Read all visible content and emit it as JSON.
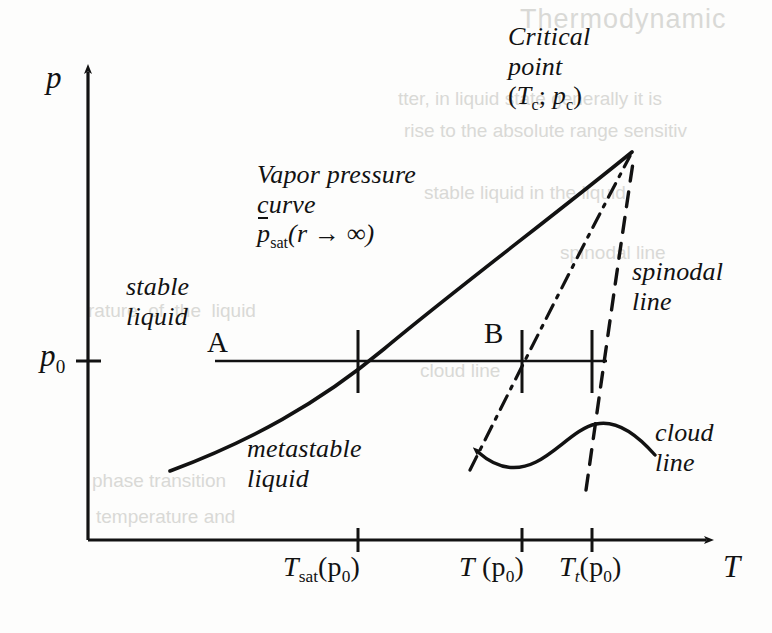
{
  "figure": {
    "kind": "phase-diagram",
    "caption": "",
    "axes": {
      "y_label": "p",
      "x_label": "T",
      "y_tick_label": "p",
      "y_tick_sub": "0",
      "x_ticks": [
        {
          "main": "T",
          "sub": "sat",
          "arg": "(p",
          "arg_sub": "0",
          "arg_close": ")"
        },
        {
          "main": "T",
          "sub": "",
          "arg": " (p",
          "arg_sub": "0",
          "arg_close": ")"
        },
        {
          "main": "T",
          "sub": "t",
          "arg": "(p",
          "arg_sub": "0",
          "arg_close": ")"
        }
      ]
    },
    "regions": [
      {
        "id": "stable",
        "line1": "stable",
        "line2": "liquid"
      },
      {
        "id": "metastable",
        "line1": "metastable",
        "line2": "liquid"
      }
    ],
    "annotations": {
      "vapor_curve": {
        "line1": "Vapor pressure",
        "line2": "curve",
        "formula_p": "p",
        "formula_sub": "sat",
        "formula_arg": "(r → ∞)"
      },
      "critical_point": {
        "line1": "Critical",
        "line2": "point",
        "coords_open": "(",
        "coords_T": "T",
        "coords_T_sub": "c",
        "coords_sep": "; ",
        "coords_p": "p",
        "coords_p_sub": "c",
        "coords_close": ")"
      },
      "spinodal": {
        "line1": "spinodal",
        "line2": "line"
      },
      "cloud": {
        "line1": "cloud",
        "line2": "line"
      }
    },
    "points": [
      {
        "id": "A",
        "label": "A"
      },
      {
        "id": "B",
        "label": "B"
      }
    ],
    "colors": {
      "ink": "#121212",
      "paper": "#fdfdfc",
      "showthrough": "#d9d9d6"
    },
    "showthrough_text": {
      "heading": "Thermodynamic",
      "body_1": "tter, in liquid state generally it is",
      "body_2": "rise to the absolute range sensitiv",
      "body_3": "stable liquid in the liquid",
      "body_4": "spinodal line",
      "body_5": "rature  of  the  liquid",
      "body_6": "cloud line",
      "body_7": "phase transition",
      "body_8": "temperature and"
    }
  }
}
